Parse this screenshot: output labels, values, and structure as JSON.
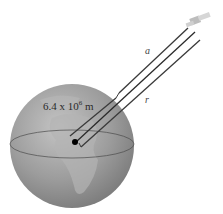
{
  "diagram": {
    "earth": {
      "radius_label_base": "6.4 x 10",
      "radius_label_exp": "6",
      "radius_label_unit": " m",
      "fill_color": "#9a9a9a",
      "land_color": "#b8b8b8"
    },
    "satellite": {
      "name": "satellite"
    },
    "labels": {
      "a": "a",
      "r": "r"
    },
    "lines": [
      {
        "name": "dimension-line-a",
        "label": "a"
      },
      {
        "name": "center-to-satellite-line",
        "label": ""
      },
      {
        "name": "dimension-line-r",
        "label": "r"
      }
    ]
  }
}
